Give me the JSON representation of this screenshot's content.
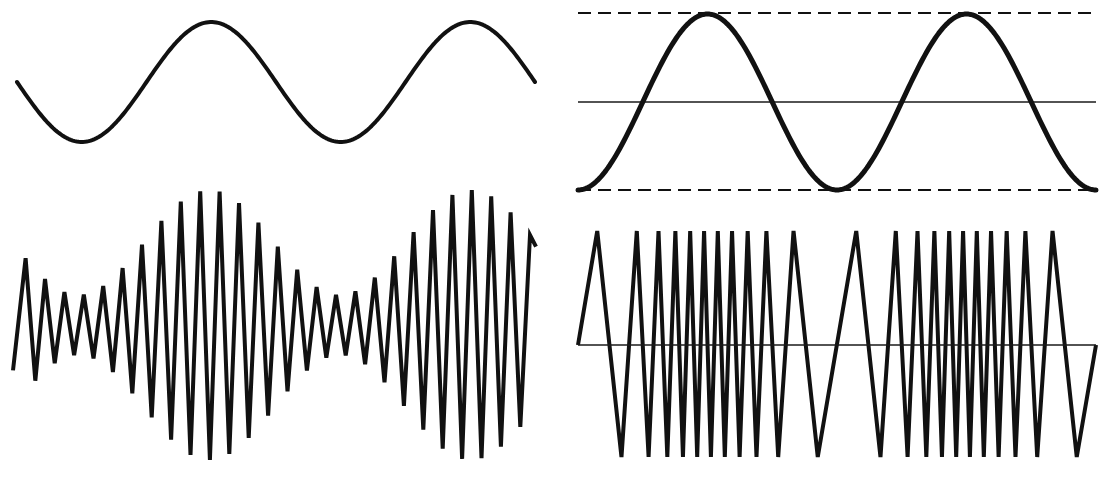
{
  "figure": {
    "background_color": "#ffffff",
    "stroke_color": "#111111",
    "width": 1101,
    "height": 480,
    "panels": [
      {
        "id": "am-modulating",
        "name": "amplitude-modulation-modulating-signal",
        "label": "Smooth sine modulating signal (top left)",
        "kind": "sine",
        "has_axis_line": false,
        "has_envelope_lines": false
      },
      {
        "id": "am-modulated",
        "name": "amplitude-modulated-carrier",
        "label": "Amplitude modulated triangular carrier (bottom left)",
        "kind": "am-carrier",
        "has_axis_line": false,
        "has_envelope_lines": false
      },
      {
        "id": "fm-modulating",
        "name": "frequency-modulation-modulating-signal",
        "label": "Sine modulating signal with peak envelope guides (top right)",
        "kind": "sine",
        "has_axis_line": true,
        "has_envelope_lines": true
      },
      {
        "id": "fm-modulated",
        "name": "frequency-modulated-carrier",
        "label": "Frequency modulated triangular carrier (bottom right)",
        "kind": "fm-carrier",
        "has_axis_line": true,
        "has_envelope_lines": false
      }
    ]
  },
  "chart_data": [
    {
      "id": "am-modulating",
      "type": "line",
      "title": "",
      "xlabel": "",
      "ylabel": "",
      "grid": false,
      "legend": "none",
      "description": "Low frequency sine modulating wave, two full cycles",
      "stroke_width": 4,
      "x_range": [
        17,
        535
      ],
      "y_range": [
        22,
        142
      ],
      "baseline_y": 82,
      "amplitude_px": 60,
      "cycles": 2,
      "phase_deg": 180,
      "period_px": 259,
      "samples": 260
    },
    {
      "id": "am-modulated",
      "type": "line",
      "title": "",
      "xlabel": "",
      "ylabel": "",
      "grid": false,
      "legend": "none",
      "description": "Triangular carrier whose amplitude is modulated by the sine above; two high amplitude bursts",
      "stroke_width": 4,
      "x_start": 13,
      "x_end": 536,
      "baseline_y": 325,
      "carrier_period_px": 19.4,
      "carrier_phase_offset_px": 6,
      "envelope": {
        "min_amplitude_px": 30,
        "max_amplitude_px": 135,
        "cycles": 2,
        "phase_deg": 180,
        "period_px": 259
      },
      "peak_x_positions": [
        26,
        45,
        64,
        84,
        103,
        122,
        141,
        161,
        180,
        200,
        219,
        238,
        257,
        277,
        296,
        315,
        335,
        354,
        374,
        393,
        412,
        431,
        451,
        470,
        490,
        509,
        528
      ],
      "n_carrier_cycles": 27
    },
    {
      "id": "fm-modulating",
      "type": "line",
      "title": "",
      "xlabel": "",
      "ylabel": "",
      "grid": true,
      "legend": "none",
      "description": "Sine modulating wave with dashed peak and trough guide lines and a solid zero axis",
      "stroke_width": 5,
      "x_range": [
        578,
        1096
      ],
      "y_range": [
        13,
        190
      ],
      "baseline_y": 102,
      "amplitude_px": 88,
      "cycles": 2,
      "phase_deg": 270,
      "period_px": 259,
      "samples": 260,
      "guides": {
        "upper_dashed_y": 13,
        "lower_dashed_y": 190,
        "axis_y": 102,
        "dash_length_px": 13,
        "gap_length_px": 7,
        "guide_stroke_width": 2,
        "axis_stroke_width": 1.6
      }
    },
    {
      "id": "fm-modulated",
      "type": "line",
      "title": "",
      "xlabel": "",
      "ylabel": "",
      "grid": true,
      "legend": "none",
      "description": "Constant amplitude triangular carrier whose frequency follows the sine above; crowded near sine peaks, sparse near sine troughs",
      "stroke_width": 4,
      "x_start": 578,
      "x_end": 1096,
      "baseline_y": 345,
      "peak_y": 231,
      "trough_y": 457,
      "amplitude_px": 113,
      "axis_y": 345,
      "axis_stroke_width": 1.6,
      "frequency_modulation": {
        "carrier_cycles": 22,
        "deviation_ratio": 0.72,
        "modulation_cycles": 2,
        "modulation_phase_deg": 270
      },
      "peak_x_positions": [
        588,
        640,
        682,
        709,
        726,
        734,
        748,
        781,
        816,
        853,
        888,
        917,
        940,
        956,
        964,
        975,
        1002,
        1038,
        1070
      ]
    }
  ]
}
